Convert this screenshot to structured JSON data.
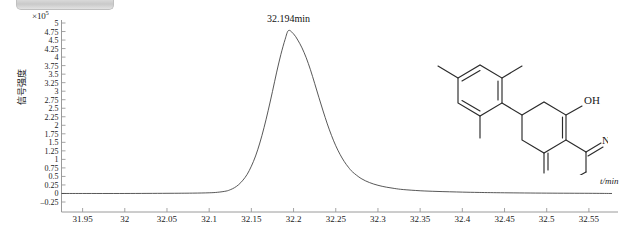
{
  "window": {
    "banner_label": ""
  },
  "axes": {
    "y_title": "信号强度",
    "y_exponent_base": "×10",
    "y_exponent_power": "5",
    "x_title": "t/min",
    "y_ticks": [
      "5",
      "4.75",
      "4.5",
      "4.25",
      "4",
      "3.75",
      "3.5",
      "3.25",
      "3",
      "2.75",
      "2.5",
      "2.25",
      "2",
      "1.75",
      "1.5",
      "1.25",
      "1",
      "0.75",
      "0.5",
      "0.25",
      "0",
      "-0.25"
    ],
    "x_ticks": [
      "31.95",
      "32",
      "32.05",
      "32.1",
      "32.15",
      "32.2",
      "32.25",
      "32.3",
      "32.35",
      "32.4",
      "32.45",
      "32.5",
      "32.55"
    ]
  },
  "annotations": {
    "peak_label": "32.194min"
  },
  "structure": {
    "label_oh": "OH",
    "label_o_ketone": "O",
    "label_n": "N",
    "label_o_ether": "O"
  },
  "colors": {
    "trace": "#3a3a3a",
    "axis": "#9a9a9a",
    "text": "#1a1a1a",
    "banner": "#cccccc"
  },
  "chart_data": {
    "type": "line",
    "title": "",
    "xlabel": "t/min",
    "ylabel": "信号强度",
    "y_multiplier": 100000,
    "xlim": [
      31.925,
      32.575
    ],
    "ylim": [
      -0.25,
      5.0
    ],
    "grid": false,
    "legend": null,
    "peaks": [
      {
        "retention_time": 32.194,
        "height": 4.78,
        "label": "32.194min"
      }
    ],
    "series": [
      {
        "name": "TIC",
        "x": [
          31.925,
          31.95,
          32.0,
          32.05,
          32.08,
          32.1,
          32.11,
          32.12,
          32.125,
          32.13,
          32.135,
          32.14,
          32.145,
          32.15,
          32.155,
          32.16,
          32.165,
          32.17,
          32.175,
          32.18,
          32.185,
          32.19,
          32.194,
          32.2,
          32.205,
          32.21,
          32.215,
          32.22,
          32.225,
          32.23,
          32.235,
          32.24,
          32.245,
          32.25,
          32.255,
          32.26,
          32.265,
          32.27,
          32.28,
          32.29,
          32.3,
          32.31,
          32.32,
          32.33,
          32.35,
          32.37,
          32.4,
          32.42,
          32.45,
          32.5,
          32.55,
          32.575
        ],
        "y": [
          0.0,
          0.0,
          0.0,
          0.005,
          0.01,
          0.02,
          0.035,
          0.07,
          0.11,
          0.17,
          0.26,
          0.39,
          0.56,
          0.8,
          1.1,
          1.48,
          1.93,
          2.44,
          2.99,
          3.56,
          4.08,
          4.52,
          4.78,
          4.68,
          4.5,
          4.27,
          3.98,
          3.63,
          3.23,
          2.82,
          2.42,
          2.04,
          1.7,
          1.4,
          1.15,
          0.94,
          0.77,
          0.63,
          0.44,
          0.32,
          0.24,
          0.185,
          0.145,
          0.115,
          0.08,
          0.06,
          0.04,
          0.03,
          0.02,
          0.01,
          0.005,
          0.0
        ]
      }
    ]
  }
}
